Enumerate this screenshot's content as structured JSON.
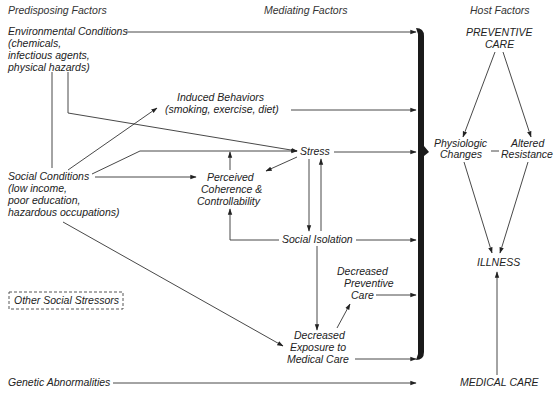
{
  "headers": {
    "predisposing": "Predisposing Factors",
    "mediating": "Mediating Factors",
    "host": "Host Factors"
  },
  "predisposing": {
    "environmental": [
      "Environmental Conditions",
      "(chemicals,",
      "infectious agents,",
      "physical hazards)"
    ],
    "social": [
      "Social Conditions",
      "(low income,",
      "poor education,",
      "hazardous occupations)"
    ],
    "other_stressors": "Other Social Stressors",
    "genetic": "Genetic Abnormalities"
  },
  "mediating": {
    "induced_behaviors": [
      "Induced Behaviors",
      "(smoking, exercise, diet)"
    ],
    "stress": "Stress",
    "perceived_coherence": [
      "Perceived",
      "Coherence &",
      "Controllability"
    ],
    "social_isolation": "Social Isolation",
    "decreased_preventive": [
      "Decreased",
      "Preventive",
      "Care"
    ],
    "decreased_exposure": [
      "Decreased",
      "Exposure to",
      "Medical Care"
    ]
  },
  "host": {
    "preventive_care": [
      "PREVENTIVE",
      "CARE"
    ],
    "physiologic_changes": [
      "Physiologic",
      "Changes"
    ],
    "altered_resistance": [
      "Altered",
      "Resistance"
    ],
    "illness": "ILLNESS",
    "medical_care": "MEDICAL CARE"
  },
  "colors": {
    "line": "#333333",
    "bracket": "#1a1a1a",
    "text": "#222222"
  }
}
